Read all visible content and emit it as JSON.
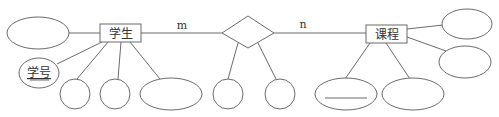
{
  "diagram": {
    "type": "er-diagram",
    "entities": [
      {
        "id": "student",
        "label": "学生"
      },
      {
        "id": "course",
        "label": "课程"
      }
    ],
    "relationship": {
      "id": "rel",
      "label": ""
    },
    "cardinality": {
      "student_side": "m",
      "course_side": "n"
    },
    "attributes": {
      "student": [
        {
          "label": "",
          "key": false
        },
        {
          "label": "学号",
          "key": true
        },
        {
          "label": "",
          "key": false
        },
        {
          "label": "",
          "key": false
        },
        {
          "label": "",
          "key": false
        }
      ],
      "relationship": [
        {
          "label": ""
        },
        {
          "label": ""
        }
      ],
      "course": [
        {
          "label": "",
          "key": false
        },
        {
          "label": "",
          "key": false
        },
        {
          "label": "",
          "key": true
        },
        {
          "label": "",
          "key": false
        }
      ]
    },
    "colors": {
      "stroke": "#6b6b6b",
      "text": "#333333",
      "background": "#ffffff"
    }
  }
}
